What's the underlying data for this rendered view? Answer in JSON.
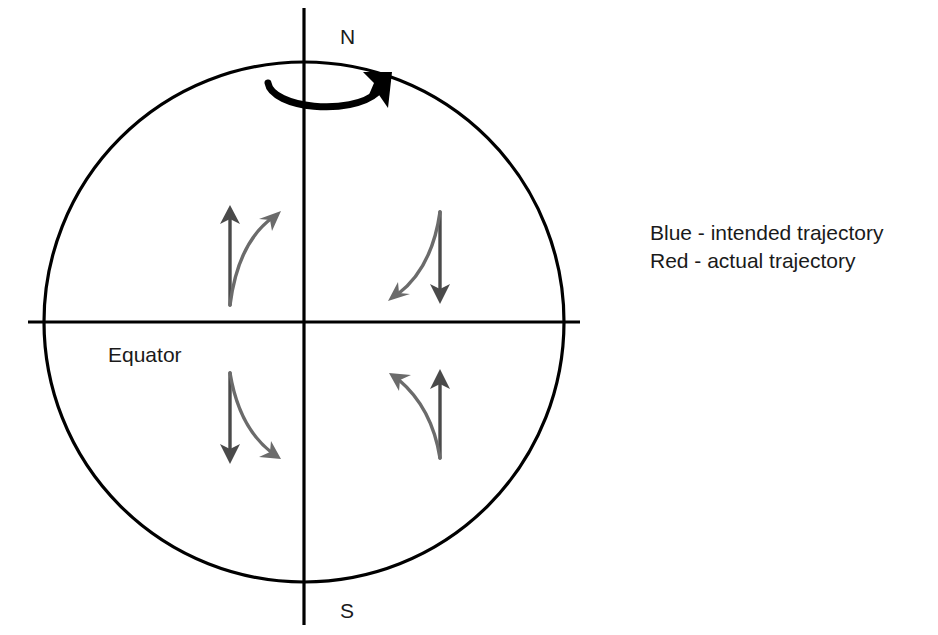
{
  "diagram": {
    "globe": {
      "center_x": 304,
      "center_y": 322,
      "radius": 260,
      "outline_color": "#000000",
      "outline_width": 3.2
    },
    "axis": {
      "name": "rotation-axis",
      "x": 304,
      "top_y": 8,
      "bottom_y": 625,
      "color": "#000000",
      "width": 3.2
    },
    "equator": {
      "name": "equator-line",
      "y": 322,
      "left_x": 28,
      "right_x": 580,
      "color": "#000000",
      "width": 3.2,
      "label": "Equator",
      "label_x": 108,
      "label_y": 362
    },
    "poles": {
      "north_label": "N",
      "north_x": 340,
      "north_y": 44,
      "south_label": "S",
      "south_x": 340,
      "south_y": 618
    },
    "rotation_arrow": {
      "name": "earth-rotation-arrow",
      "direction": "counterclockwise viewed from north pole (west to east)",
      "color": "#000000",
      "stroke_width": 7
    },
    "quadrants": [
      {
        "id": "northern-hemisphere-west",
        "hemisphere": "Northern",
        "side": "west",
        "intended": {
          "label": "intended trajectory",
          "direction": "north",
          "start_x": 230,
          "start_y": 305,
          "end_x": 230,
          "end_y": 210
        },
        "actual": {
          "label": "actual trajectory",
          "deflection": "right",
          "start_x": 230,
          "start_y": 305,
          "end_x": 277,
          "end_y": 212,
          "ctrl_x": 238,
          "ctrl_y": 243
        }
      },
      {
        "id": "northern-hemisphere-east",
        "hemisphere": "Northern",
        "side": "east",
        "intended": {
          "label": "intended trajectory",
          "direction": "south",
          "start_x": 440,
          "start_y": 212,
          "end_x": 440,
          "end_y": 302
        },
        "actual": {
          "label": "actual trajectory",
          "deflection": "right",
          "start_x": 440,
          "start_y": 212,
          "end_x": 392,
          "end_y": 300,
          "ctrl_x": 432,
          "ctrl_y": 268
        }
      },
      {
        "id": "southern-hemisphere-west",
        "hemisphere": "Southern",
        "side": "west",
        "intended": {
          "label": "intended trajectory",
          "direction": "south",
          "start_x": 230,
          "start_y": 373,
          "end_x": 230,
          "end_y": 462
        },
        "actual": {
          "label": "actual trajectory",
          "deflection": "left",
          "start_x": 230,
          "start_y": 373,
          "end_x": 277,
          "end_y": 458,
          "ctrl_x": 239,
          "ctrl_y": 427
        }
      },
      {
        "id": "southern-hemisphere-east",
        "hemisphere": "Southern",
        "side": "east",
        "intended": {
          "label": "intended trajectory",
          "direction": "north",
          "start_x": 440,
          "start_y": 458,
          "end_x": 440,
          "end_y": 373
        },
        "actual": {
          "label": "actual trajectory",
          "deflection": "left",
          "start_x": 440,
          "start_y": 458,
          "end_x": 393,
          "end_y": 374,
          "ctrl_x": 432,
          "ctrl_y": 408
        }
      }
    ],
    "arrow_style": {
      "intended_color": "#4a4a4a",
      "actual_color": "#6b6b6b",
      "stroke_width": 3.4
    },
    "legend": {
      "x": 650,
      "line1_y": 240,
      "line2_y": 268,
      "items": [
        {
          "text": "Blue - intended trajectory",
          "color_name": "Blue"
        },
        {
          "text": "Red - actual trajectory",
          "color_name": "Red"
        }
      ]
    }
  }
}
